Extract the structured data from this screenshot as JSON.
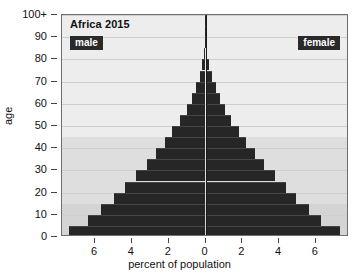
{
  "chart_data": {
    "type": "bar",
    "subtype": "population-pyramid",
    "title": "Africa 2015",
    "xlabel": "percent of population",
    "ylabel": "age",
    "xlim": [
      -7.8,
      7.8
    ],
    "xticks": [
      "6",
      "4",
      "2",
      "0",
      "2",
      "4",
      "6"
    ],
    "xtick_values": [
      -6,
      -4,
      -2,
      0,
      2,
      4,
      6
    ],
    "ylim": [
      0,
      100
    ],
    "yticks": [
      "0",
      "10",
      "20",
      "30",
      "40",
      "50",
      "60",
      "70",
      "80",
      "90",
      "100+"
    ],
    "ytick_values": [
      0,
      10,
      20,
      30,
      40,
      50,
      60,
      70,
      80,
      90,
      100
    ],
    "grid": true,
    "legend_position": "inside-top-left-and-top-right",
    "bar_color": "#262626",
    "plot_background": "#ededed",
    "series": [
      {
        "name": "male",
        "side": "left",
        "values": [
          7.4,
          6.4,
          5.7,
          5.0,
          4.4,
          3.8,
          3.2,
          2.7,
          2.2,
          1.8,
          1.4,
          1.0,
          0.75,
          0.5,
          0.3,
          0.17,
          0.08,
          0.03,
          0.01,
          0.004,
          0.001
        ]
      },
      {
        "name": "female",
        "side": "right",
        "values": [
          7.3,
          6.3,
          5.6,
          4.9,
          4.4,
          3.8,
          3.2,
          2.7,
          2.2,
          1.8,
          1.4,
          1.05,
          0.8,
          0.55,
          0.33,
          0.2,
          0.1,
          0.04,
          0.012,
          0.005,
          0.001
        ]
      }
    ],
    "age_groups": [
      "0-4",
      "5-9",
      "10-14",
      "15-19",
      "20-24",
      "25-29",
      "30-34",
      "35-39",
      "40-44",
      "45-49",
      "50-54",
      "55-59",
      "60-64",
      "65-69",
      "70-74",
      "75-79",
      "80-84",
      "85-89",
      "90-94",
      "95-99",
      "100+"
    ],
    "age_group_starts": [
      0,
      5,
      10,
      15,
      20,
      25,
      30,
      35,
      40,
      45,
      50,
      55,
      60,
      65,
      70,
      75,
      80,
      85,
      90,
      95,
      100
    ],
    "background_bands": [
      {
        "from": 0,
        "to": 15,
        "color": "#d4d4d4"
      },
      {
        "from": 15,
        "to": 45,
        "color": "#dedede"
      },
      {
        "from": 45,
        "to": 100,
        "color": "#ededed"
      }
    ]
  },
  "legend": {
    "male_label": "male",
    "female_label": "female"
  }
}
